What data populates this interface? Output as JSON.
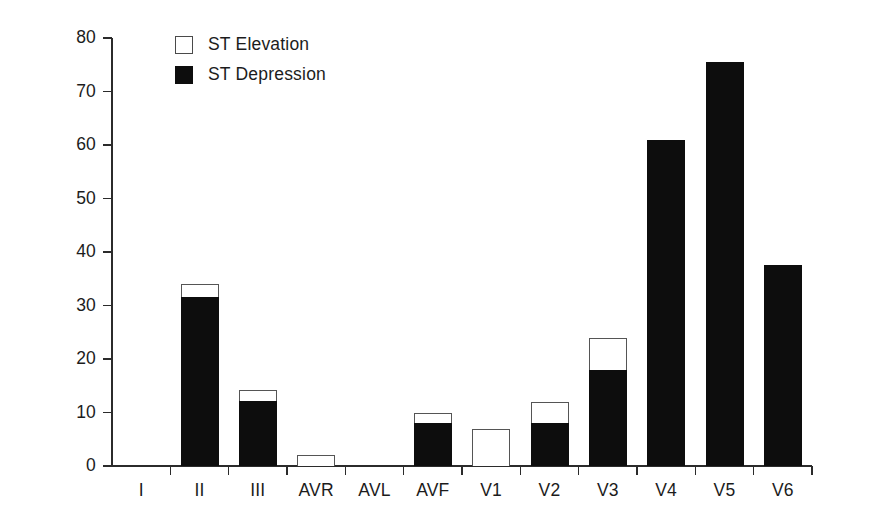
{
  "chart_data": {
    "type": "bar",
    "title": "",
    "subtitle": "",
    "xlabel": "",
    "ylabel": "",
    "ylim": [
      0,
      80
    ],
    "ytick_step": 10,
    "yticks": [
      0,
      10,
      20,
      30,
      40,
      50,
      60,
      70,
      80
    ],
    "ytick_labels": [
      "0",
      "10",
      "20",
      "30",
      "40",
      "50",
      "60",
      "70",
      "80"
    ],
    "grid": false,
    "stacked": true,
    "legend_position": "top-left",
    "categories": [
      "I",
      "II",
      "III",
      "AVR",
      "AVL",
      "AVF",
      "V1",
      "V2",
      "V3",
      "V4",
      "V5",
      "V6"
    ],
    "series": [
      {
        "name": "ST Depression",
        "color": "#0d0d0d",
        "fill": "solid-black",
        "values": [
          0,
          31.5,
          12.2,
          0,
          0,
          8,
          0,
          8,
          18,
          61,
          75.5,
          37.5
        ]
      },
      {
        "name": "ST Elevation",
        "color": "#ffffff",
        "fill": "open-white",
        "values": [
          0,
          2.5,
          2.1,
          2,
          0,
          2,
          7,
          4,
          6,
          0,
          0,
          0
        ]
      }
    ],
    "totals": [
      0,
      34,
      14.3,
      2,
      0,
      10,
      7,
      12,
      24,
      61,
      75.5,
      37.5
    ],
    "annotations": []
  },
  "legend": {
    "items": [
      {
        "label": "ST Elevation",
        "swatch": "open-square-icon"
      },
      {
        "label": "ST Depression",
        "swatch": "filled-square-icon"
      }
    ]
  },
  "colors": {
    "axis": "#2b2b2b",
    "depression": "#0d0d0d",
    "elevation_fill": "#ffffff",
    "elevation_stroke": "#555555",
    "background": "#ffffff",
    "text": "#1c1c1c"
  }
}
